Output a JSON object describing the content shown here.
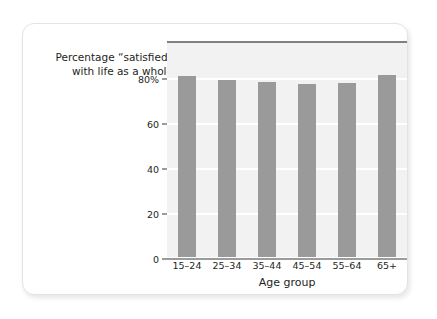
{
  "chart_data": {
    "type": "bar",
    "title": "",
    "subtitle": "",
    "ylabel": "Percentage “satisfied”\nwith life as a whole",
    "xlabel": "Age group",
    "categories": [
      "15–24",
      "25–34",
      "35–44",
      "45–54",
      "55–64",
      "65+"
    ],
    "values": [
      80.5,
      78.5,
      78,
      77,
      77.5,
      81
    ],
    "series": [
      {
        "name": "Percentage satisfied with life as a whole",
        "values": [
          80.5,
          78.5,
          78,
          77,
          77.5,
          81
        ]
      }
    ],
    "ylim": [
      0,
      96
    ],
    "yticks": [
      0,
      20,
      40,
      60,
      80
    ],
    "ytick_labels": [
      "0",
      "20",
      "40",
      "60",
      "80%"
    ],
    "grid": true,
    "legend": null,
    "bar_color": "#9a9a9a",
    "plot_background": "#f2f2f2",
    "gridline_color": "#ffffff",
    "axis_color": "#9b9b9b",
    "plot_top_border_color": "#808080"
  },
  "card": {
    "background": "#ffffff",
    "border_color": "#e3e3e3"
  }
}
